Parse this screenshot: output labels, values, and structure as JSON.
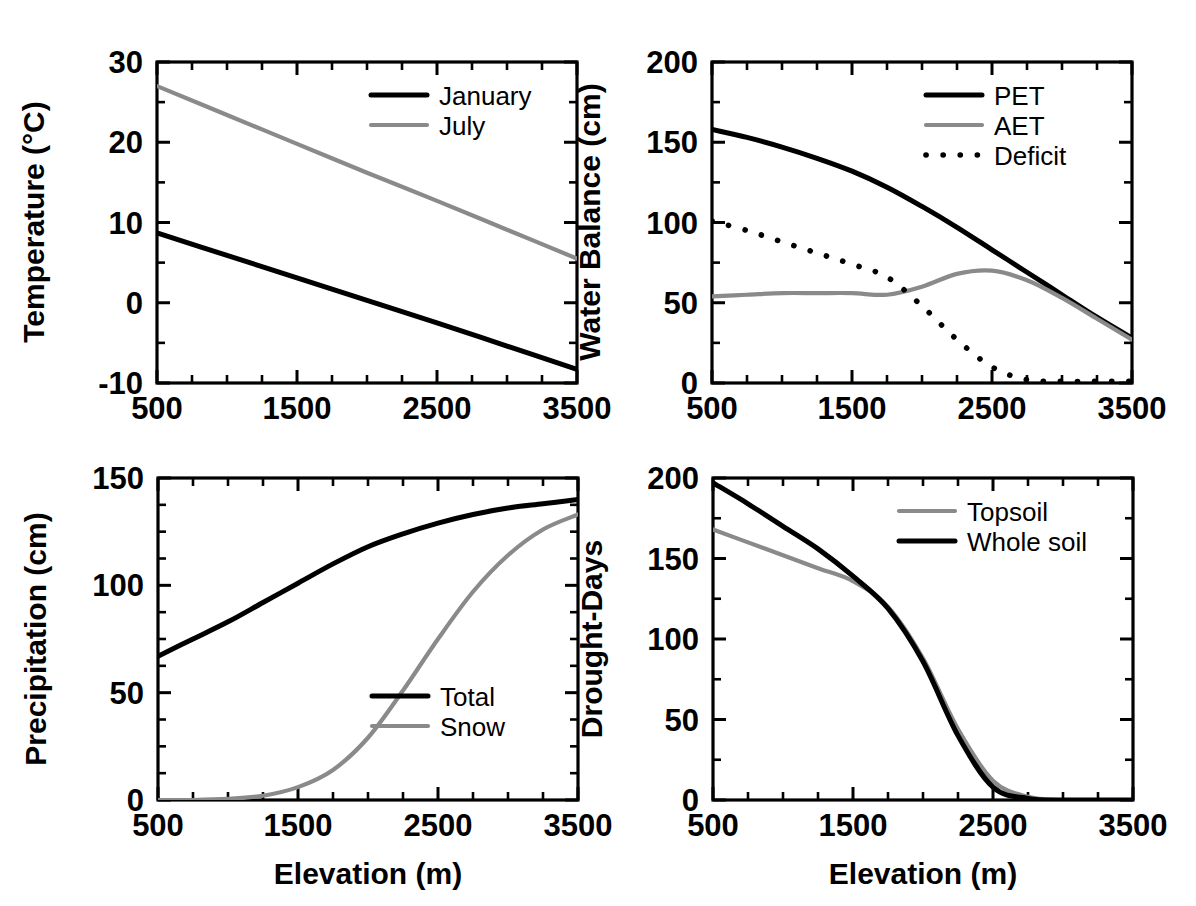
{
  "figure": {
    "title": "",
    "background_color": "#ffffff",
    "line_colors": {
      "black": "#000000",
      "gray": "#8a8a8a"
    }
  },
  "chart_data": [
    {
      "id": "temperature",
      "type": "line",
      "title": "",
      "xlabel": "",
      "ylabel": "Temperature (°C)",
      "xlim": [
        500,
        3500
      ],
      "ylim": [
        -10,
        30
      ],
      "xticks": [
        500,
        1500,
        2500,
        3500
      ],
      "xtick_labels": [
        "500",
        "1500",
        "2500",
        "3500"
      ],
      "yticks": [
        -10,
        0,
        10,
        20,
        30
      ],
      "ytick_labels": [
        "-10",
        "0",
        "10",
        "20",
        "30"
      ],
      "xminor_step": 250,
      "yminor_step": 5,
      "grid": false,
      "legend_position": "top-right",
      "x": [
        500,
        1000,
        1500,
        2000,
        2500,
        3000,
        3500
      ],
      "series": [
        {
          "name": "January",
          "style": "solid",
          "color": "#000000",
          "values": [
            8.7,
            5.9,
            3.1,
            0.3,
            -2.5,
            -5.4,
            -8.3
          ]
        },
        {
          "name": "July",
          "style": "gray",
          "color": "#8a8a8a",
          "values": [
            27.0,
            23.4,
            19.8,
            16.2,
            12.7,
            9.1,
            5.5
          ]
        }
      ]
    },
    {
      "id": "water-balance",
      "type": "line",
      "title": "",
      "xlabel": "",
      "ylabel": "Water Balance (cm)",
      "xlim": [
        500,
        3500
      ],
      "ylim": [
        0,
        200
      ],
      "xticks": [
        500,
        1500,
        2500,
        3500
      ],
      "xtick_labels": [
        "500",
        "1500",
        "2500",
        "3500"
      ],
      "yticks": [
        0,
        50,
        100,
        150,
        200
      ],
      "ytick_labels": [
        "0",
        "50",
        "100",
        "150",
        "200"
      ],
      "xminor_step": 250,
      "yminor_step": 25,
      "grid": false,
      "legend_position": "top-right",
      "x": [
        500,
        750,
        1000,
        1250,
        1500,
        1750,
        2000,
        2250,
        2500,
        2750,
        3000,
        3250,
        3500
      ],
      "series": [
        {
          "name": "PET",
          "style": "solid",
          "color": "#000000",
          "values": [
            158,
            153,
            147,
            140,
            132,
            122,
            110,
            97,
            83,
            69,
            55,
            41,
            28
          ]
        },
        {
          "name": "AET",
          "style": "gray",
          "color": "#8a8a8a",
          "values": [
            54,
            55,
            56,
            56,
            56,
            55,
            60,
            68,
            70,
            64,
            53,
            40,
            27
          ]
        },
        {
          "name": "Deficit",
          "style": "dotted",
          "color": "#000000",
          "values": [
            101,
            95,
            88,
            81,
            74,
            66,
            48,
            27,
            10,
            2,
            1,
            1,
            1
          ]
        }
      ]
    },
    {
      "id": "precipitation",
      "type": "line",
      "title": "",
      "xlabel": "Elevation (m)",
      "ylabel": "Precipitation (cm)",
      "xlim": [
        500,
        3500
      ],
      "ylim": [
        0,
        150
      ],
      "xticks": [
        500,
        1500,
        2500,
        3500
      ],
      "xtick_labels": [
        "500",
        "1500",
        "2500",
        "3500"
      ],
      "yticks": [
        0,
        50,
        100,
        150
      ],
      "ytick_labels": [
        "0",
        "50",
        "100",
        "150"
      ],
      "xminor_step": 250,
      "yminor_step": 12.5,
      "grid": false,
      "legend_position": "lower-right",
      "x": [
        500,
        750,
        1000,
        1250,
        1500,
        1750,
        2000,
        2250,
        2500,
        2750,
        3000,
        3250,
        3500
      ],
      "series": [
        {
          "name": "Total",
          "style": "solid",
          "color": "#000000",
          "values": [
            67,
            75,
            83,
            92,
            101,
            110,
            118,
            124,
            129,
            133,
            136,
            138,
            140
          ]
        },
        {
          "name": "Snow",
          "style": "gray",
          "color": "#8a8a8a",
          "values": [
            0,
            0,
            0.5,
            2,
            6,
            14,
            29,
            51,
            75,
            97,
            114,
            126,
            133
          ]
        }
      ]
    },
    {
      "id": "drought-days",
      "type": "line",
      "title": "",
      "xlabel": "Elevation (m)",
      "ylabel": "Drought-Days",
      "xlim": [
        500,
        3500
      ],
      "ylim": [
        0,
        200
      ],
      "xticks": [
        500,
        1500,
        2500,
        3500
      ],
      "xtick_labels": [
        "500",
        "1500",
        "2500",
        "3500"
      ],
      "yticks": [
        0,
        50,
        100,
        150,
        200
      ],
      "ytick_labels": [
        "0",
        "50",
        "100",
        "150",
        "200"
      ],
      "xminor_step": 250,
      "yminor_step": 25,
      "grid": false,
      "legend_position": "top-right",
      "x": [
        500,
        750,
        1000,
        1250,
        1500,
        1750,
        2000,
        2250,
        2500,
        2750,
        3000,
        3250,
        3500
      ],
      "series": [
        {
          "name": "Topsoil",
          "style": "gray",
          "color": "#8a8a8a",
          "values": [
            168,
            160,
            152,
            144,
            136,
            120,
            88,
            44,
            12,
            2,
            0,
            0,
            0
          ]
        },
        {
          "name": "Whole soil",
          "style": "solid",
          "color": "#000000",
          "values": [
            197,
            184,
            170,
            156,
            139,
            119,
            86,
            40,
            8,
            1,
            0,
            0,
            0
          ]
        }
      ]
    }
  ]
}
